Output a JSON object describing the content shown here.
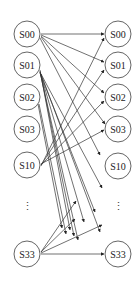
{
  "diagram": {
    "radius": 13,
    "left_nodes": [
      {
        "id": "L_S00",
        "label": "S00",
        "x": 27,
        "y": 34
      },
      {
        "id": "L_S01",
        "label": "S01",
        "x": 27,
        "y": 65
      },
      {
        "id": "L_S02",
        "label": "S02",
        "x": 27,
        "y": 97
      },
      {
        "id": "L_S03",
        "label": "S03",
        "x": 27,
        "y": 129
      },
      {
        "id": "L_S10",
        "label": "S10",
        "x": 27,
        "y": 165
      },
      {
        "id": "L_S33",
        "label": "S33",
        "x": 27,
        "y": 254
      }
    ],
    "right_nodes": [
      {
        "id": "R_S00",
        "label": "S00",
        "x": 118,
        "y": 34
      },
      {
        "id": "R_S01",
        "label": "S01",
        "x": 118,
        "y": 65
      },
      {
        "id": "R_S02",
        "label": "S02",
        "x": 118,
        "y": 97
      },
      {
        "id": "R_S03",
        "label": "S03",
        "x": 118,
        "y": 129
      },
      {
        "id": "R_S10",
        "label": "S10",
        "x": 118,
        "y": 166
      },
      {
        "id": "R_S33",
        "label": "S33",
        "x": 118,
        "y": 254
      }
    ],
    "ellipsis": [
      {
        "label": "⋮",
        "x": 27,
        "y": 210
      },
      {
        "label": "⋮",
        "x": 118,
        "y": 210
      }
    ],
    "edges": [
      {
        "from": [
          41,
          34
        ],
        "to": [
          104,
          34
        ]
      },
      {
        "from": [
          41,
          35
        ],
        "to": [
          104,
          62
        ]
      },
      {
        "from": [
          41,
          36
        ],
        "to": [
          104,
          93
        ]
      },
      {
        "from": [
          41,
          37
        ],
        "to": [
          105,
          124
        ]
      },
      {
        "from": [
          40,
          38
        ],
        "to": [
          100,
          155
        ]
      },
      {
        "from": [
          40,
          70
        ],
        "to": [
          70,
          230
        ]
      },
      {
        "from": [
          40,
          71
        ],
        "to": [
          74,
          236
        ]
      },
      {
        "from": [
          40,
          72
        ],
        "to": [
          78,
          240
        ]
      },
      {
        "from": [
          40,
          72
        ],
        "to": [
          84,
          222
        ]
      },
      {
        "from": [
          40,
          73
        ],
        "to": [
          95,
          212
        ]
      },
      {
        "from": [
          41,
          74
        ],
        "to": [
          102,
          188
        ]
      },
      {
        "from": [
          41,
          74
        ],
        "to": [
          100,
          232
        ]
      },
      {
        "from": [
          38,
          104
        ],
        "to": [
          62,
          228
        ]
      },
      {
        "from": [
          39,
          104
        ],
        "to": [
          66,
          234
        ]
      },
      {
        "from": [
          41,
          166
        ],
        "to": [
          104,
          38
        ]
      },
      {
        "from": [
          41,
          165
        ],
        "to": [
          104,
          70
        ]
      },
      {
        "from": [
          41,
          165
        ],
        "to": [
          104,
          101
        ]
      },
      {
        "from": [
          41,
          164
        ],
        "to": [
          104,
          130
        ]
      },
      {
        "from": [
          41,
          252
        ],
        "to": [
          76,
          201
        ]
      },
      {
        "from": [
          41,
          252
        ],
        "to": [
          75,
          219
        ]
      },
      {
        "from": [
          41,
          253
        ],
        "to": [
          102,
          225
        ]
      },
      {
        "from": [
          41,
          254
        ],
        "to": [
          104,
          254
        ]
      }
    ]
  }
}
